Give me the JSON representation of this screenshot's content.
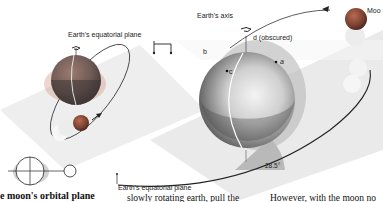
{
  "figure": {
    "left_panel": {
      "plane_label": "Earth's equatorial plane",
      "caption": "e moon's orbital plane"
    },
    "right_panel": {
      "axis_label": "Earth's axis",
      "point_b": "b",
      "point_c": "c",
      "point_d": "d (obscured)",
      "point_a": "a",
      "moon_label": "Moo",
      "angle_label": "28.5°",
      "plane_label": "Earth's equatorial plane"
    },
    "body_text": {
      "col1": "slowly rotating earth, pull the",
      "col2": "However, with the moon no"
    },
    "colors": {
      "sphere_dark": "#5a5a5a",
      "sphere_light": "#d8d8d8",
      "moon": "#8a5040",
      "plane": "#e6e6e6",
      "angle_wedge": "#b8b8b8"
    }
  }
}
